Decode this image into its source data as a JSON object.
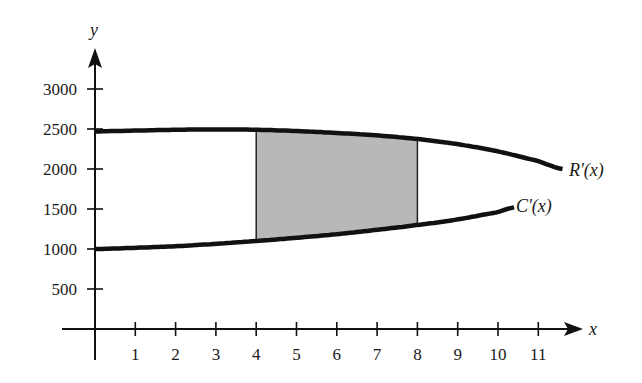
{
  "chart_data": {
    "type": "line",
    "title": "",
    "xlabel": "x",
    "ylabel": "y",
    "xlim": [
      0,
      12
    ],
    "ylim": [
      0,
      3200
    ],
    "x_ticks": [
      1,
      2,
      3,
      4,
      5,
      6,
      7,
      8,
      9,
      10,
      11
    ],
    "y_ticks": [
      500,
      1000,
      1500,
      2000,
      2500,
      3000
    ],
    "grid": false,
    "legend": "none (curves labeled inline)",
    "series": [
      {
        "name": "R'(x)",
        "x": [
          0,
          1,
          2,
          3,
          4,
          5,
          6,
          7,
          8,
          9,
          10,
          11,
          11.6
        ],
        "y": [
          2470,
          2480,
          2490,
          2495,
          2490,
          2475,
          2450,
          2420,
          2375,
          2310,
          2220,
          2100,
          2000
        ]
      },
      {
        "name": "C'(x)",
        "x": [
          0,
          1,
          2,
          3,
          4,
          5,
          6,
          7,
          8,
          9,
          10,
          10.4
        ],
        "y": [
          1000,
          1015,
          1035,
          1065,
          1100,
          1140,
          1185,
          1240,
          1300,
          1370,
          1460,
          1520
        ]
      }
    ],
    "shaded_region": {
      "between": [
        "R'(x)",
        "C'(x)"
      ],
      "x_from": 4,
      "x_to": 8,
      "fill": "#b8b8b8"
    },
    "annotations": [
      {
        "text": "R'(x)",
        "x": 11.8,
        "y": 2000
      },
      {
        "text": "C'(x)",
        "x": 10.6,
        "y": 1520
      }
    ]
  },
  "labels": {
    "x_axis": "x",
    "y_axis": "y",
    "r_curve": "R'(x)",
    "c_curve": "C'(x)",
    "x_ticks": [
      "1",
      "2",
      "3",
      "4",
      "5",
      "6",
      "7",
      "8",
      "9",
      "10",
      "11"
    ],
    "y_ticks": [
      "500",
      "1000",
      "1500",
      "2000",
      "2500",
      "3000"
    ]
  },
  "colors": {
    "ink": "#111111",
    "shade": "#b8b8b8",
    "background": "#ffffff"
  }
}
